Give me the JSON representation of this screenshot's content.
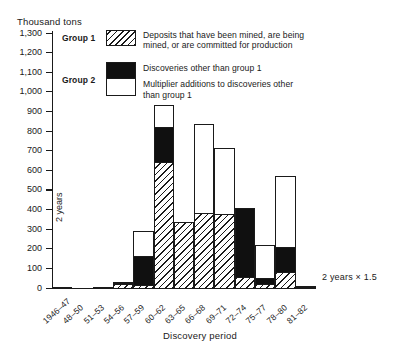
{
  "chart_data": {
    "type": "bar",
    "stacked": true,
    "title": "",
    "ylabel": "Thousand tons",
    "xlabel": "Discovery period",
    "ylim": [
      0,
      1300
    ],
    "ytick_step": 100,
    "ytick_labels": [
      "0",
      "100",
      "200",
      "300",
      "400",
      "500",
      "600",
      "700",
      "800",
      "900",
      "1,000",
      "1,100",
      "1,200",
      "1,300"
    ],
    "grid": false,
    "legend_position": "top-right",
    "categories": [
      "1946–47",
      "48–50",
      "51–53",
      "54–56",
      "57–59",
      "60–62",
      "63–65",
      "66–68",
      "69–71",
      "72–74",
      "75–77",
      "78–80",
      "81–82"
    ],
    "series": [
      {
        "name": "Deposits that have been mined, are being mined, or are committed for production",
        "group": "Group 1",
        "pattern": "hatched",
        "values": [
          8,
          0,
          8,
          25,
          20,
          650,
          340,
          390,
          385,
          60,
          25,
          85,
          10
        ]
      },
      {
        "name": "Discoveries other than group 1",
        "group": "Group 2",
        "pattern": "solid-black",
        "values": [
          0,
          0,
          0,
          5,
          155,
          180,
          0,
          0,
          0,
          360,
          35,
          135,
          0
        ]
      },
      {
        "name": "Multiplier additions to discoveries other than group 1",
        "group": "Group 2",
        "pattern": "white",
        "values": [
          0,
          0,
          0,
          10,
          130,
          120,
          0,
          455,
          340,
          0,
          175,
          370,
          10
        ]
      }
    ],
    "totals": [
      8,
      0,
      8,
      40,
      305,
      950,
      340,
      845,
      725,
      420,
      235,
      590,
      20
    ],
    "annotations": [
      {
        "text": "2 years",
        "position": "left-inside-vertical"
      },
      {
        "text": "2 years  ×  1.5",
        "position": "right-of-axis"
      }
    ]
  },
  "legend": {
    "group1_label": "Group 1",
    "group2_label": "Group 2",
    "entry1_line1": "Deposits that have been mined, are being",
    "entry1_line2": "mined, or are committed for production",
    "entry2_line1": "Discoveries other than group 1",
    "entry3_line1": "Multiplier additions to discoveries other",
    "entry3_line2": "than group 1"
  }
}
